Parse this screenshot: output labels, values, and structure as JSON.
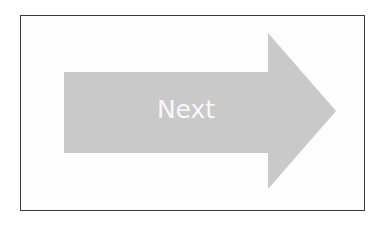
{
  "button": {
    "label": "Next",
    "icon": "right-arrow-icon",
    "fill_color": "#c9c9c9",
    "text_color": "#f8f8f8"
  },
  "frame": {
    "border_color": "#3a3a3a"
  }
}
